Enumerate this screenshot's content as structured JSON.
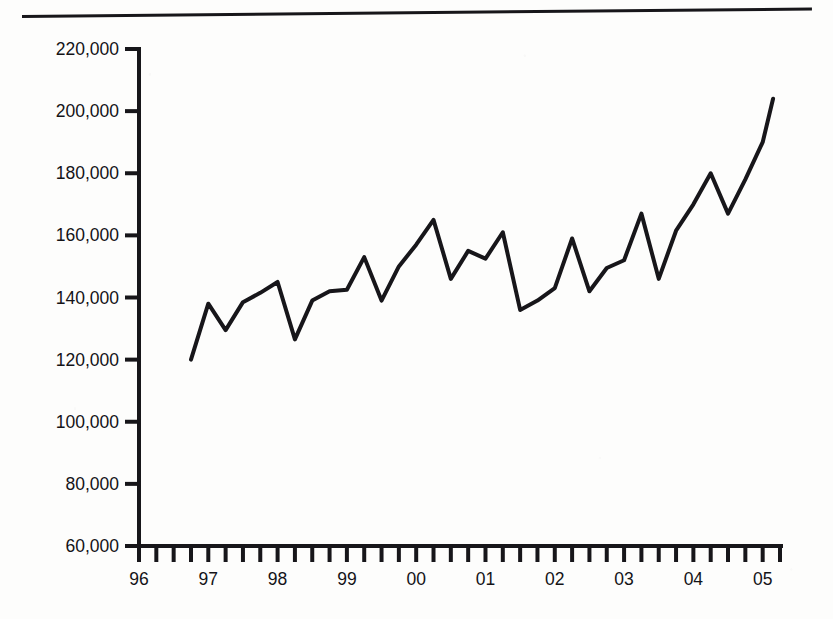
{
  "page": {
    "background_color": "#fdfdfc",
    "ink_color": "#17161a",
    "top_rule_name": "horizontal-rule"
  },
  "chart_data": {
    "type": "line",
    "title": "",
    "subtitle": "",
    "xlabel": "",
    "ylabel": "",
    "grid": false,
    "legend": false,
    "legend_position": "none",
    "line_color": "#17161a",
    "line_width": 4,
    "ylim": [
      60000,
      220000
    ],
    "ytick_step": 20000,
    "ytick_labels": [
      "220,000",
      "200,000",
      "180,000",
      "160,000",
      "140,000",
      "120,000",
      "100,000",
      "80,000",
      "60,000"
    ],
    "ytick_values": [
      220000,
      200000,
      180000,
      160000,
      140000,
      120000,
      100000,
      80000,
      60000
    ],
    "xtick_labels": [
      "96",
      "97",
      "98",
      "99",
      "00",
      "01",
      "02",
      "03",
      "04",
      "05"
    ],
    "xtick_values": [
      1996,
      1997,
      1998,
      1999,
      2000,
      2001,
      2002,
      2003,
      2004,
      2005
    ],
    "x_minor_ticks_per_interval": 4,
    "x_axis_note": "quarterly minor ticks between year labels",
    "xlim": [
      1996.0,
      2005.25
    ],
    "series": [
      {
        "name": "series-1",
        "x": [
          1996.75,
          1997.0,
          1997.25,
          1997.5,
          1997.75,
          1998.0,
          1998.25,
          1998.5,
          1998.75,
          1999.0,
          1999.25,
          1999.5,
          1999.75,
          2000.0,
          2000.25,
          2000.5,
          2000.75,
          2001.0,
          2001.25,
          2001.5,
          2001.75,
          2002.0,
          2002.25,
          2002.5,
          2002.75,
          2003.0,
          2003.25,
          2003.5,
          2003.75,
          2004.0,
          2004.25,
          2004.5,
          2004.75,
          2005.0,
          2005.15
        ],
        "values": [
          120000,
          138000,
          129500,
          138500,
          141500,
          145000,
          126500,
          139000,
          142000,
          142500,
          153000,
          139000,
          150000,
          157000,
          165000,
          146000,
          155000,
          152500,
          161000,
          136000,
          139000,
          143000,
          159000,
          142000,
          149500,
          152000,
          167000,
          146000,
          161500,
          170000,
          180000,
          167000,
          178000,
          190000,
          204000
        ]
      }
    ]
  },
  "geometry": {
    "plot_left_px": 139,
    "plot_right_px": 780,
    "y_top_px": 49,
    "y_bottom_px": 546,
    "y_top_value": 220000,
    "y_bottom_value": 60000,
    "x_left_year": 1996.0,
    "x_right_year": 2005.25
  }
}
